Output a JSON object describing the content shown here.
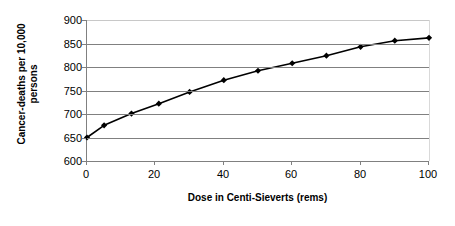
{
  "chart_data": {
    "type": "line",
    "title": "",
    "xlabel": "Dose in Centi-Sieverts (rems)",
    "ylabel": "Cancer-deaths per 10,000 persons",
    "ylabel_lines": [
      "Cancer-deaths per 10,000",
      "persons"
    ],
    "xlim": [
      0,
      100
    ],
    "ylim": [
      600,
      900
    ],
    "xticks": [
      0,
      20,
      40,
      60,
      80,
      100
    ],
    "xtick_labels": [
      "0",
      "20",
      "40",
      "60",
      "80",
      "100"
    ],
    "yticks": [
      600,
      650,
      700,
      750,
      800,
      850,
      900
    ],
    "ytick_labels": [
      "600",
      "650",
      "700",
      "750",
      "800",
      "850",
      "900"
    ],
    "grid": "horizontal",
    "legend": "none",
    "marker": "diamond",
    "line_color": "#000000",
    "marker_color": "#000000",
    "grid_color": "#808080",
    "x": [
      0,
      5,
      13,
      21,
      30,
      40,
      50,
      60,
      70,
      80,
      90,
      100
    ],
    "values": [
      650,
      676,
      701,
      722,
      747,
      772,
      792,
      808,
      824,
      843,
      856,
      862
    ],
    "series": [
      {
        "name": "Cancer-deaths per 10,000 persons",
        "x": [
          0,
          5,
          13,
          21,
          30,
          40,
          50,
          60,
          70,
          80,
          90,
          100
        ],
        "values": [
          650,
          676,
          701,
          722,
          747,
          772,
          792,
          808,
          824,
          843,
          856,
          862
        ]
      }
    ]
  }
}
